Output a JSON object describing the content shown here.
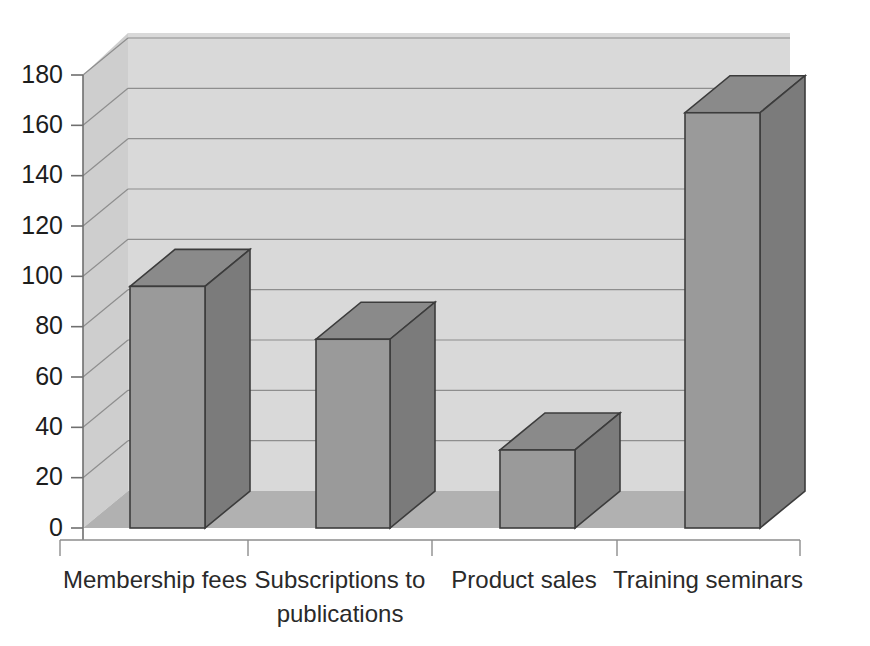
{
  "chart_data": {
    "type": "bar",
    "title": "",
    "subtitle": "",
    "xlabel": "",
    "ylabel": "",
    "categories": [
      "Membership fees",
      "Subscriptions to publications",
      "Product sales",
      "Training seminars"
    ],
    "category_lines": [
      [
        "Membership fees"
      ],
      [
        "Subscriptions to",
        "publications"
      ],
      [
        "Product sales"
      ],
      [
        "Training seminars"
      ]
    ],
    "values": [
      96,
      75,
      31,
      165
    ],
    "ylim": [
      0,
      180
    ],
    "ytick_labels": [
      "0",
      "20",
      "40",
      "60",
      "80",
      "100",
      "120",
      "140",
      "160",
      "180"
    ],
    "ytick_values": [
      0,
      20,
      40,
      60,
      80,
      100,
      120,
      140,
      160,
      180
    ],
    "grid": true,
    "grid_axis": "y",
    "legend": false,
    "legend_position": "none",
    "style": "3d-column",
    "colors": {
      "bar_front": "#9a9a9a",
      "bar_side": "#7b7b7b",
      "bar_top": "#8a8a8a",
      "bar_outline": "#3c3c3c",
      "wall_back": "#d9d9d9",
      "wall_left": "#cfcfcf",
      "floor": "#b4b4b4",
      "gridline": "#8e8e8e",
      "axis": "#6f6f6f",
      "text": "#1d1d1d",
      "background": "#ffffff"
    }
  },
  "axes": {
    "y_axis_name": "value-axis",
    "x_axis_name": "category-axis"
  }
}
